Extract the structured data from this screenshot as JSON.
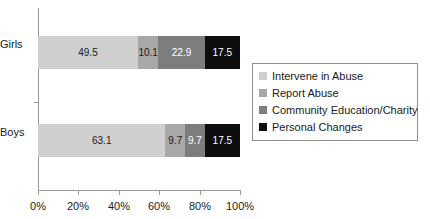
{
  "chart_data": {
    "type": "bar",
    "orientation": "horizontal",
    "stacked": true,
    "normalized_percent": true,
    "title": "",
    "subtitle": "",
    "xlabel": "",
    "ylabel": "",
    "xlim": [
      0,
      100
    ],
    "grid": false,
    "categories": [
      "Girls",
      "Boys"
    ],
    "tick_labels": [
      "0%",
      "20%",
      "40%",
      "60%",
      "80%",
      "100%"
    ],
    "tick_values": [
      0,
      20,
      40,
      60,
      80,
      100
    ],
    "legend_position": "right",
    "series": [
      {
        "name": "Intervene in Abuse",
        "color": "#cfcfcf",
        "label_color": "#1a1a1a",
        "values": [
          49.5,
          63.1
        ],
        "labels": [
          "49.5",
          "63.1"
        ]
      },
      {
        "name": "Report Abuse",
        "color": "#a8a8a8",
        "label_color": "#1a1a1a",
        "values": [
          10.1,
          9.7
        ],
        "labels": [
          "10.1",
          "9.7"
        ]
      },
      {
        "name": "Community Education/Charity",
        "color": "#7d7d7d",
        "label_color": "#ffffff",
        "values": [
          22.9,
          9.7
        ],
        "labels": [
          "22.9",
          "9.7"
        ]
      },
      {
        "name": "Personal Changes",
        "color": "#0d0d0d",
        "label_color": "#ffffff",
        "values": [
          17.5,
          17.5
        ],
        "labels": [
          "17.5",
          "17.5"
        ]
      }
    ]
  },
  "axis": {
    "line_color": "#9a9a9a"
  },
  "legend": {
    "border_color": "#8e8e8e",
    "items": [
      {
        "label": "Intervene in Abuse",
        "color": "#cfcfcf"
      },
      {
        "label": "Report Abuse",
        "color": "#a8a8a8"
      },
      {
        "label": "Community Education/Charity",
        "color": "#7d7d7d"
      },
      {
        "label": "Personal Changes",
        "color": "#0d0d0d"
      }
    ]
  }
}
